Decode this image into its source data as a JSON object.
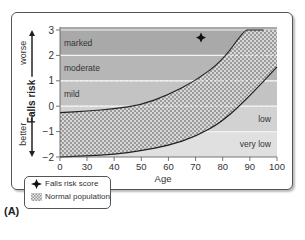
{
  "chart_data": {
    "type": "area",
    "title": "",
    "panel_label": "(A)",
    "xlabel": "Age",
    "ylabel": "Falls risk",
    "ylabel_up": "worse",
    "ylabel_down": "better",
    "xlim": [
      0,
      100
    ],
    "ylim": [
      -2,
      3
    ],
    "x_ticks": [
      0,
      30,
      40,
      50,
      60,
      70,
      80,
      90,
      100
    ],
    "y_ticks": [
      -2,
      -1,
      0,
      1,
      2,
      3
    ],
    "bands": [
      {
        "label": "marked",
        "from": 2,
        "to": 3
      },
      {
        "label": "moderate",
        "from": 1,
        "to": 2
      },
      {
        "label": "mild",
        "from": 0,
        "to": 1
      },
      {
        "label": "low",
        "from": -1,
        "to": 0
      },
      {
        "label": "very low",
        "from": -2,
        "to": -1
      }
    ],
    "series": [
      {
        "name": "Normal population (upper bound)",
        "x": [
          0,
          30,
          40,
          50,
          60,
          70,
          80,
          88,
          90,
          100
        ],
        "values": [
          -0.25,
          -0.2,
          -0.1,
          0.05,
          0.45,
          1.0,
          1.8,
          3.0,
          3.0,
          3.0
        ]
      },
      {
        "name": "Normal population (lower bound)",
        "x": [
          0,
          30,
          40,
          50,
          60,
          70,
          80,
          90,
          100
        ],
        "values": [
          -2.0,
          -1.95,
          -1.9,
          -1.75,
          -1.55,
          -1.2,
          -0.6,
          0.4,
          1.55
        ]
      },
      {
        "name": "Falls risk score",
        "type": "scatter",
        "x": [
          72
        ],
        "values": [
          2.7
        ]
      }
    ],
    "legend": [
      "Falls risk score",
      "Normal population"
    ],
    "legend_position": "bottom-left"
  },
  "labels": {
    "legend_score": "Falls risk score",
    "legend_normal": "Normal population",
    "panel": "(A)"
  }
}
